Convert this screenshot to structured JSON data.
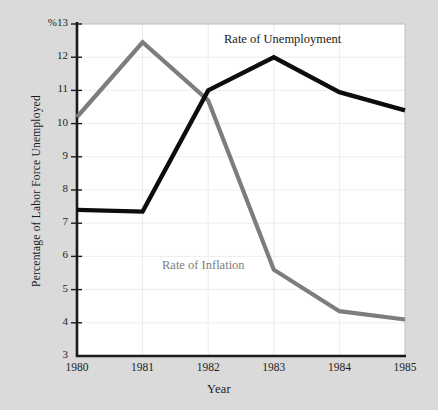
{
  "figure": {
    "background_color": "#dadada",
    "plot_background_color": "#ffffff",
    "gridline_color": "#ededed",
    "axis_color": "#1a1a1a"
  },
  "axes": {
    "y_title": "Percentage of Labor Force Unemployed",
    "x_title": "Year",
    "y_top_label": "%13",
    "y_ticks": [
      "13",
      "12",
      "11",
      "10",
      "9",
      "8",
      "7",
      "6",
      "5",
      "4",
      "3"
    ],
    "x_ticks": [
      "1980",
      "1981",
      "1982",
      "1983",
      "1984",
      "1985"
    ]
  },
  "legend": {
    "unemployment_label": "Rate of Unemployment",
    "inflation_label": "Rate of Inflation"
  },
  "chart_data": {
    "type": "line",
    "title": "",
    "xlabel": "Year",
    "ylabel": "Percentage of Labor Force Unemployed",
    "x": [
      1980,
      1981,
      1982,
      1983,
      1984,
      1985
    ],
    "categories": [
      "1980",
      "1981",
      "1982",
      "1983",
      "1984",
      "1985"
    ],
    "xlim": [
      1980,
      1985
    ],
    "ylim": [
      3,
      13
    ],
    "grid": true,
    "legend_position": "inline-annotations",
    "series": [
      {
        "name": "Rate of Unemployment",
        "color": "#0d0d0d",
        "values": [
          7.4,
          7.35,
          11.0,
          12.0,
          10.95,
          10.4
        ]
      },
      {
        "name": "Rate of Inflation",
        "color": "#7d7d7d",
        "values": [
          10.2,
          12.45,
          10.7,
          5.6,
          4.35,
          4.1
        ]
      }
    ]
  }
}
